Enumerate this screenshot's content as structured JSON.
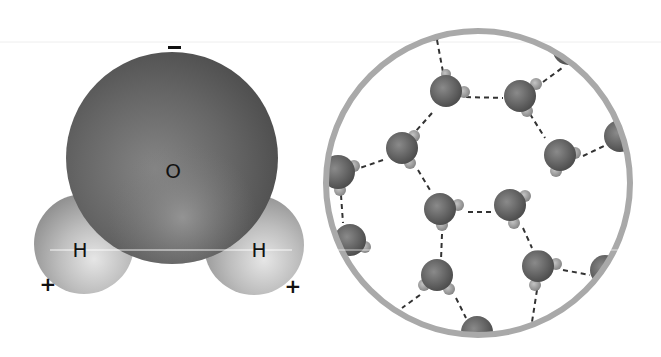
{
  "single_molecule": {
    "atoms": [
      {
        "symbol": "O",
        "label": "O",
        "cx": 172,
        "cy": 158,
        "r": 106
      },
      {
        "symbol": "H",
        "label": "H",
        "cx": 84,
        "cy": 244,
        "r": 50
      },
      {
        "symbol": "H",
        "label": "H",
        "cx": 254,
        "cy": 245,
        "r": 50
      }
    ],
    "charges": {
      "oxygen": "–",
      "hydrogen_left": "+",
      "hydrogen_right": "+"
    }
  },
  "network": {
    "circle": {
      "cx": 478,
      "cy": 183,
      "r": 152,
      "stroke": "#a9a9a9"
    },
    "molecules": [
      {
        "x": 432,
        "y": 28
      },
      {
        "x": 446,
        "y": 89
      },
      {
        "x": 520,
        "y": 96
      },
      {
        "x": 402,
        "y": 148
      },
      {
        "x": 560,
        "y": 154
      },
      {
        "x": 622,
        "y": 134
      },
      {
        "x": 339,
        "y": 172
      },
      {
        "x": 440,
        "y": 208
      },
      {
        "x": 510,
        "y": 206
      },
      {
        "x": 352,
        "y": 240
      },
      {
        "x": 437,
        "y": 277
      },
      {
        "x": 538,
        "y": 266
      },
      {
        "x": 605,
        "y": 268
      },
      {
        "x": 477,
        "y": 330
      },
      {
        "x": 568,
        "y": 50
      }
    ],
    "bond_style": "dashed",
    "bond_label": "hydrogen bond"
  },
  "colors": {
    "oxygen": "#5e5e5e",
    "hydrogen": "#b8b8b8",
    "bond": "#333333",
    "label": "#111111"
  }
}
